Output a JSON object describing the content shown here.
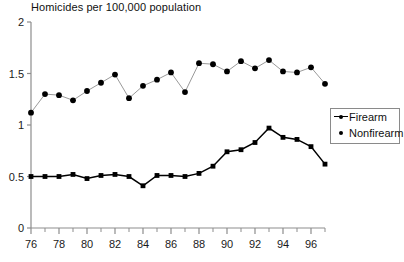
{
  "chart_data": {
    "type": "line",
    "title": "Homicides per 100,000 population",
    "xlabel": "",
    "ylabel": "",
    "xlim": [
      76,
      97
    ],
    "ylim": [
      0,
      2
    ],
    "yticks": [
      0,
      0.5,
      1,
      1.5,
      2
    ],
    "ytick_labels": [
      "0",
      "0.5",
      "1",
      "1.5",
      "2"
    ],
    "xticks": [
      76,
      78,
      80,
      82,
      84,
      86,
      88,
      90,
      92,
      94,
      96
    ],
    "xtick_labels": [
      "76",
      "78",
      "80",
      "82",
      "84",
      "86",
      "88",
      "90",
      "92",
      "94",
      "96"
    ],
    "minor_xticks": [
      77,
      79,
      81,
      83,
      85,
      87,
      89,
      91,
      93,
      95,
      97
    ],
    "grid": false,
    "legend_position": "right",
    "x": [
      76,
      77,
      78,
      79,
      80,
      81,
      82,
      83,
      84,
      85,
      86,
      87,
      88,
      89,
      90,
      91,
      92,
      93,
      94,
      95,
      96,
      97
    ],
    "series": [
      {
        "name": "Firearm",
        "marker": "square",
        "color": "#000000",
        "line_color": "#000000",
        "values": [
          0.5,
          0.5,
          0.5,
          0.52,
          0.48,
          0.51,
          0.52,
          0.5,
          0.41,
          0.51,
          0.51,
          0.5,
          0.53,
          0.6,
          0.74,
          0.76,
          0.83,
          0.97,
          0.88,
          0.86,
          0.79,
          0.62
        ]
      },
      {
        "name": "Nonfirearm",
        "marker": "circle",
        "color": "#000000",
        "line_color": "#9a9a9a",
        "values": [
          1.12,
          1.3,
          1.29,
          1.24,
          1.33,
          1.41,
          1.49,
          1.26,
          1.38,
          1.44,
          1.51,
          1.32,
          1.6,
          1.59,
          1.52,
          1.62,
          1.55,
          1.63,
          1.52,
          1.51,
          1.56,
          1.4
        ]
      }
    ]
  },
  "legend": {
    "items": [
      {
        "label": "Firearm",
        "key": "line-marker-key"
      },
      {
        "label": "Nonfirearm",
        "key": "dot-key"
      }
    ]
  }
}
